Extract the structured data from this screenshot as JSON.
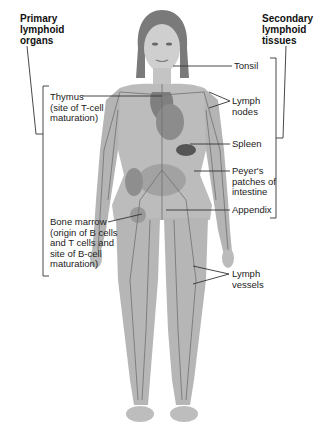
{
  "headings": {
    "primary": "Primary\nlymphoid\norgans",
    "secondary": "Secondary\nlymphoid\ntissues"
  },
  "primary_labels": [
    {
      "name": "thymus",
      "text": "Thymus\n(site of T-cell\nmaturation)"
    },
    {
      "name": "bone-marrow",
      "text": "Bone marrow\n(origin of B cells\nand T cells and\nsite of B-cell\nmaturation)"
    }
  ],
  "secondary_labels": [
    {
      "name": "tonsil",
      "text": "Tonsil"
    },
    {
      "name": "lymph-nodes",
      "text": "Lymph\nnodes"
    },
    {
      "name": "spleen",
      "text": "Spleen"
    },
    {
      "name": "peyers-patches",
      "text": "Peyer's\npatches of\nintestine"
    },
    {
      "name": "appendix",
      "text": "Appendix"
    },
    {
      "name": "lymph-vessels",
      "text": "Lymph\nvessels"
    }
  ],
  "colors": {
    "line": "#333333",
    "skin": "#bdbdbd",
    "skin_dark": "#8a8a8a",
    "hair": "#6e6e6e",
    "organ": "#5a5a5a"
  }
}
